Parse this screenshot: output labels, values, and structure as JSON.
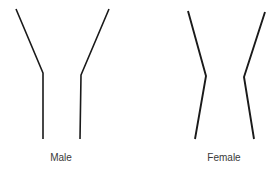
{
  "diagram": {
    "width": 280,
    "height": 171,
    "stroke_color": "#1a1a1a",
    "label_color": "#3a3a3a",
    "figures": [
      {
        "id": "male",
        "label": "Male",
        "label_x": 61,
        "stroke_width": 1.6,
        "outlines": [
          {
            "side": "left",
            "points": [
              [
                16,
                9
              ],
              [
                43,
                73
              ],
              [
                43,
                139
              ]
            ]
          },
          {
            "side": "right",
            "points": [
              [
                109,
                9
              ],
              [
                81,
                75
              ],
              [
                80,
                139
              ]
            ]
          }
        ]
      },
      {
        "id": "female",
        "label": "Female",
        "label_x": 224,
        "stroke_width": 1.9,
        "outlines": [
          {
            "side": "left",
            "points": [
              [
                188,
                11
              ],
              [
                206,
                76
              ],
              [
                195,
                139
              ]
            ]
          },
          {
            "side": "right",
            "points": [
              [
                265,
                12
              ],
              [
                244,
                77
              ],
              [
                254,
                139
              ]
            ]
          }
        ]
      }
    ]
  }
}
